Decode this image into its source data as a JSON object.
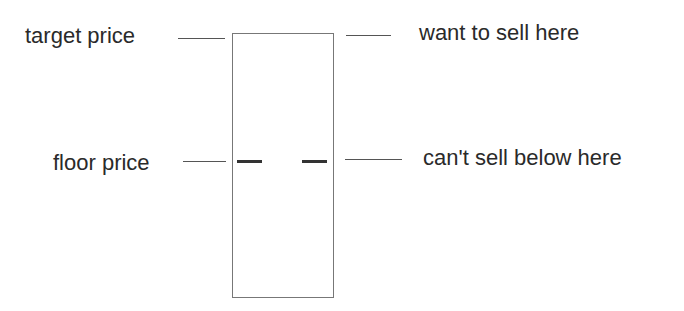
{
  "diagram": {
    "left_labels": {
      "target": "target price",
      "floor": "floor price"
    },
    "right_labels": {
      "target": "want to sell here",
      "floor": "can't sell below here"
    },
    "colors": {
      "text": "#2a2a2a",
      "lines": "#555555",
      "box": "#777777",
      "floor_marks": "#333333"
    }
  }
}
